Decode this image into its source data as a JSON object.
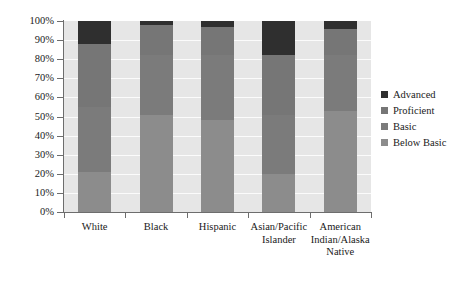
{
  "chart_data": {
    "type": "bar",
    "subtype": "stacked-bar-100",
    "title": "",
    "xlabel": "",
    "ylabel": "",
    "ylim": [
      0,
      100
    ],
    "grid": true,
    "legend_position": "right",
    "categories": [
      "White",
      "Black",
      "Hispanic",
      "Asian/Pacific Islander",
      "American Indian/Alaska Native"
    ],
    "category_label_lines": [
      [
        "White"
      ],
      [
        "Black"
      ],
      [
        "Hispanic"
      ],
      [
        "Asian/Pacific",
        "Islander"
      ],
      [
        "American",
        "Indian/Alaska",
        "Native"
      ]
    ],
    "ytick_labels": [
      "100%",
      "90%",
      "80%",
      "70%",
      "60%",
      "50%",
      "40%",
      "30%",
      "20%",
      "10%",
      "0%"
    ],
    "ytick_values": [
      100,
      90,
      80,
      70,
      60,
      50,
      40,
      30,
      20,
      10,
      0
    ],
    "series": [
      {
        "name": "Advanced",
        "color": "#2f2f2f",
        "values": [
          12,
          2,
          3,
          18,
          4
        ]
      },
      {
        "name": "Proficient",
        "color": "#767676",
        "values": [
          33,
          16,
          15,
          31,
          14
        ]
      },
      {
        "name": "Basic",
        "color": "#7b7b7b",
        "values": [
          34,
          31,
          34,
          31,
          29
        ]
      },
      {
        "name": "Below Basic",
        "color": "#8c8c8c",
        "values": [
          21,
          51,
          48,
          20,
          53
        ]
      }
    ],
    "cumulative_tops": {
      "White": {
        "below_basic": 21,
        "basic": 55,
        "proficient": 88,
        "advanced": 100
      },
      "Black": {
        "below_basic": 51,
        "basic": 82,
        "proficient": 98,
        "advanced": 100
      },
      "Hispanic": {
        "below_basic": 48,
        "basic": 82,
        "proficient": 97,
        "advanced": 100
      },
      "Asian/Pacific Islander": {
        "below_basic": 20,
        "basic": 51,
        "proficient": 82,
        "advanced": 100
      },
      "American Indian/Alaska Native": {
        "below_basic": 53,
        "basic": 82,
        "proficient": 96,
        "advanced": 100
      }
    },
    "plot_background": "#e6e6e6",
    "gridline_color": "#fbfbfb",
    "axis_color": "#6d6d6d"
  },
  "legend": {
    "items": [
      {
        "label": "Advanced"
      },
      {
        "label": "Proficient"
      },
      {
        "label": "Basic"
      },
      {
        "label": "Below Basic"
      }
    ]
  }
}
